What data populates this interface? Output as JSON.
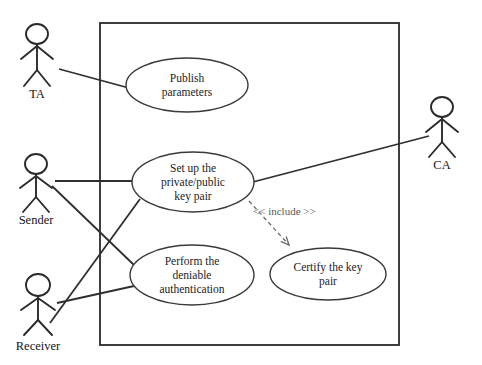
{
  "diagram": {
    "type": "uml-use-case-diagram",
    "canvas": {
      "width": 482,
      "height": 365
    },
    "background_color": "#ffffff",
    "line_color": "#2b2b2b",
    "system_boundary": {
      "name": "system-boundary",
      "x": 100,
      "y": 23,
      "width": 299,
      "height": 322,
      "label": ""
    },
    "actors": [
      {
        "id": "ta",
        "label": "TA",
        "icon": "actor-stick-figure",
        "head_cx": 37,
        "head_cy": 34,
        "head_rx": 11,
        "head_ry": 10,
        "body_top": 44,
        "body_bottom": 70,
        "arm_y": 53,
        "arm_span": 16,
        "leg_dx": 13,
        "leg_bottom": 86,
        "label_x": 37,
        "label_y": 98
      },
      {
        "id": "sender",
        "label": "Sender",
        "icon": "actor-stick-figure",
        "head_cx": 36,
        "head_cy": 164,
        "head_rx": 11,
        "head_ry": 10,
        "body_top": 174,
        "body_bottom": 197,
        "arm_y": 182,
        "arm_span": 16,
        "leg_dx": 13,
        "leg_bottom": 212,
        "label_x": 36,
        "label_y": 224
      },
      {
        "id": "receiver",
        "label": "Receiver",
        "icon": "actor-stick-figure",
        "head_cx": 38,
        "head_cy": 285,
        "head_rx": 12,
        "head_ry": 11,
        "body_top": 296,
        "body_bottom": 320,
        "arm_y": 304,
        "arm_span": 17,
        "leg_dx": 14,
        "leg_bottom": 335,
        "label_x": 38,
        "label_y": 350
      },
      {
        "id": "ca",
        "label": "CA",
        "icon": "actor-stick-figure",
        "head_cx": 442,
        "head_cy": 107,
        "head_rx": 11,
        "head_ry": 10,
        "body_top": 117,
        "body_bottom": 142,
        "arm_y": 126,
        "arm_span": 16,
        "leg_dx": 13,
        "leg_bottom": 157,
        "label_x": 442,
        "label_y": 169
      }
    ],
    "use_cases": [
      {
        "id": "publish-parameters",
        "lines": [
          "Publish",
          "parameters"
        ],
        "cx": 187,
        "cy": 85,
        "rx": 61,
        "ry": 27
      },
      {
        "id": "set-up-key-pair",
        "lines": [
          "Set up the",
          "private/public",
          "key pair"
        ],
        "cx": 193,
        "cy": 182,
        "rx": 61,
        "ry": 30
      },
      {
        "id": "perform-deniable-authentication",
        "lines": [
          "Perform the",
          "deniable",
          "authentication"
        ],
        "cx": 192,
        "cy": 275,
        "rx": 62,
        "ry": 30
      },
      {
        "id": "certify-key-pair",
        "lines": [
          "Certify the key",
          "pair"
        ],
        "cx": 328,
        "cy": 274,
        "rx": 58,
        "ry": 26
      }
    ],
    "associations": [
      {
        "id": "ta-to-publish",
        "from": "ta",
        "to": "publish-parameters",
        "x1": 59,
        "y1": 69,
        "x2": 129,
        "y2": 88
      },
      {
        "id": "sender-to-setup",
        "from": "sender",
        "to": "set-up-key-pair",
        "x1": 55,
        "y1": 181,
        "x2": 134,
        "y2": 181
      },
      {
        "id": "sender-to-perform",
        "from": "sender",
        "to": "perform-deniable-authentication",
        "x1": 52,
        "y1": 186,
        "x2": 134,
        "y2": 265
      },
      {
        "id": "receiver-to-setup",
        "from": "receiver",
        "to": "set-up-key-pair",
        "x1": 50,
        "y1": 323,
        "x2": 140,
        "y2": 199
      },
      {
        "id": "receiver-to-perform",
        "from": "receiver",
        "to": "perform-deniable-authentication",
        "x1": 57,
        "y1": 303,
        "x2": 134,
        "y2": 286
      },
      {
        "id": "setup-to-ca",
        "from": "set-up-key-pair",
        "to": "ca",
        "x1": 249,
        "y1": 183,
        "x2": 429,
        "y2": 136
      }
    ],
    "include_relationship": {
      "id": "setup-includes-certify",
      "label": "<< include >>",
      "label_x": 253,
      "label_y": 215,
      "from": "set-up-key-pair",
      "to": "certify-key-pair",
      "x1": 249,
      "y1": 201,
      "x2": 289,
      "y2": 245,
      "style": "dashed-open-arrow"
    }
  }
}
